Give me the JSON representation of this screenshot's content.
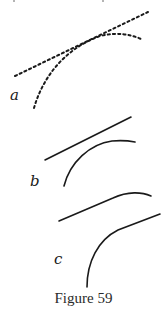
{
  "figure": {
    "caption": "Figure 59",
    "ink_color": "#1a1a1a",
    "panels": [
      {
        "label": "a",
        "style": "dotted",
        "elements": [
          "straight-line",
          "curve"
        ]
      },
      {
        "label": "b",
        "style": "solid",
        "elements": [
          "straight-line",
          "curve"
        ]
      },
      {
        "label": "c",
        "style": "solid",
        "elements": [
          "line-joining-curve",
          "curve"
        ]
      }
    ]
  }
}
